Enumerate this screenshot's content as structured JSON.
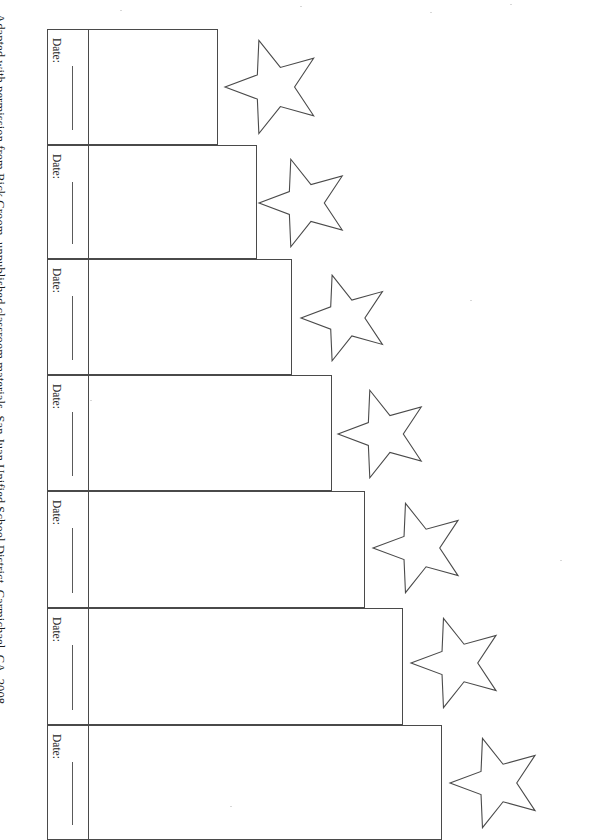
{
  "document": {
    "type": "printable-worksheet",
    "title": "Star Staircase Goal Chart",
    "background_color": "#ffffff",
    "ink_color": "#4a4a4a"
  },
  "attribution": {
    "text": "Adapted with permission from Rick Croom, unpublished classroom materials, San Juan Unified School District, Carmichael, CA, 2008.",
    "orientation": "vertical-rotated-90"
  },
  "rows": [
    {
      "date_label": "Date:",
      "x": 47,
      "y": 29,
      "width": 171,
      "height": 116,
      "divider_x": 40,
      "star": {
        "cx": 274,
        "cy": 87,
        "r": 49,
        "rotation": -18
      }
    },
    {
      "date_label": "Date:",
      "x": 47,
      "y": 145,
      "width": 210,
      "height": 114,
      "divider_x": 40,
      "star": {
        "cx": 305,
        "cy": 203,
        "r": 46,
        "rotation": -18
      }
    },
    {
      "date_label": "Date:",
      "x": 47,
      "y": 259,
      "width": 245,
      "height": 116,
      "divider_x": 40,
      "star": {
        "cx": 346,
        "cy": 318,
        "r": 45,
        "rotation": -18
      }
    },
    {
      "date_label": "Date:",
      "x": 47,
      "y": 375,
      "width": 285,
      "height": 116,
      "divider_x": 40,
      "star": {
        "cx": 384,
        "cy": 434,
        "r": 46,
        "rotation": -18
      }
    },
    {
      "date_label": "Date:",
      "x": 47,
      "y": 491,
      "width": 318,
      "height": 117,
      "divider_x": 40,
      "star": {
        "cx": 420,
        "cy": 548,
        "r": 47,
        "rotation": -18
      }
    },
    {
      "date_label": "Date:",
      "x": 47,
      "y": 608,
      "width": 356,
      "height": 117,
      "divider_x": 40,
      "star": {
        "cx": 458,
        "cy": 663,
        "r": 47,
        "rotation": -18
      }
    },
    {
      "date_label": "Date:",
      "x": 47,
      "y": 725,
      "width": 395,
      "height": 115,
      "divider_x": 40,
      "star": {
        "cx": 497,
        "cy": 783,
        "r": 47,
        "rotation": -18
      }
    }
  ],
  "star_shape": {
    "points": 5,
    "inner_ratio": 0.42,
    "fill": "#ffffff",
    "stroke": "#4a4a4a"
  }
}
